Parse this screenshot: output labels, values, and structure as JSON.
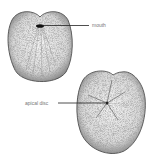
{
  "figure": {
    "views": [
      {
        "name": "oral view",
        "label": "mouth"
      },
      {
        "name": "aboral view",
        "label": "apical disc"
      }
    ]
  },
  "labels": {
    "mouth": "mouth",
    "apical_disc": "apical disc"
  },
  "colors": {
    "background": "#ffffff",
    "stipple": "#555555",
    "outline": "#333333",
    "label_text": "#777777",
    "leader_line": "#222222"
  }
}
